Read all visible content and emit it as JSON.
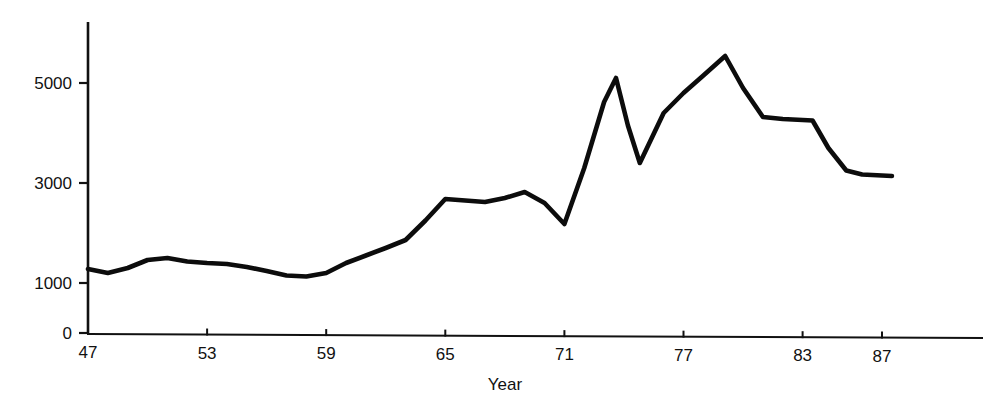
{
  "chart_data": {
    "type": "line",
    "title": "",
    "subtitle": "",
    "xlabel": "Year",
    "ylabel": "",
    "grid": false,
    "legend": null,
    "xlim": [
      47,
      92.1
    ],
    "ylim": [
      0,
      6120
    ],
    "x_tick_labels": [
      "47",
      "53",
      "59",
      "65",
      "71",
      "77",
      "83",
      "87"
    ],
    "x_ticks": [
      47,
      53,
      59,
      65,
      71,
      77,
      83,
      87
    ],
    "y_tick_labels": [
      "0",
      "1000",
      "3000",
      "5000"
    ],
    "y_ticks": [
      0,
      1000,
      3000,
      5000
    ],
    "x": [
      47,
      48,
      49,
      50,
      51,
      52,
      53,
      54,
      55,
      56,
      57,
      58,
      59,
      60,
      61,
      62,
      63,
      64,
      65,
      66,
      67,
      68,
      69,
      70,
      71,
      72,
      73,
      73.6,
      74.2,
      74.8,
      75.4,
      76,
      77,
      78,
      79.1,
      80,
      81,
      82,
      83,
      83.5,
      84.3,
      85.2,
      86,
      87,
      87.5
    ],
    "values": [
      1280,
      1200,
      1300,
      1460,
      1500,
      1430,
      1400,
      1380,
      1320,
      1240,
      1150,
      1130,
      1200,
      1400,
      1550,
      1700,
      1860,
      2250,
      2680,
      2650,
      2620,
      2700,
      2820,
      2600,
      2180,
      3300,
      4620,
      5100,
      4150,
      3400,
      3900,
      4400,
      4800,
      5150,
      5540,
      4900,
      4320,
      4280,
      4260,
      4250,
      3700,
      3250,
      3170,
      3150,
      3140
    ],
    "annotations": [],
    "series_name": ""
  },
  "axes": {
    "x_axis_name": "year-axis",
    "y_axis_name": "value-axis"
  }
}
